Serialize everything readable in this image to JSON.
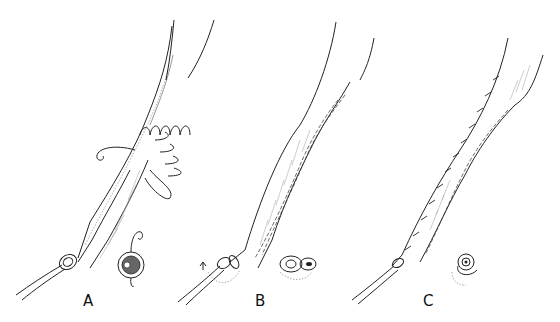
{
  "figure": {
    "panels": [
      {
        "label": "A",
        "description": "Tube with running loop sutures placed along its length; inset cross-section showing suture through tube wall"
      },
      {
        "label": "B",
        "description": "Sutures tightened forming a seam along the tube; inset cross-section showing folded closure with arrow"
      },
      {
        "label": "C",
        "description": "Completed closure with interrupted stitch marks along edge; inset cross-section with rotation arrow"
      }
    ],
    "colors": {
      "line": "#222222",
      "background": "#ffffff"
    }
  }
}
